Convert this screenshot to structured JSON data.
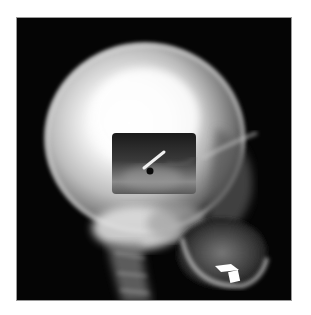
{
  "image": {
    "subject": "Lateral skull X-ray radiograph",
    "background_color": "#ffffff",
    "film_color": "#050505",
    "inset": {
      "description": "Rectangular inset window with darker exposure showing a linear foreign object (needle) and a small dark round spot",
      "object": "needle"
    },
    "features": [
      "cranium",
      "inset-window",
      "needle",
      "cervical-spine",
      "mandible",
      "dental-fillings"
    ]
  }
}
